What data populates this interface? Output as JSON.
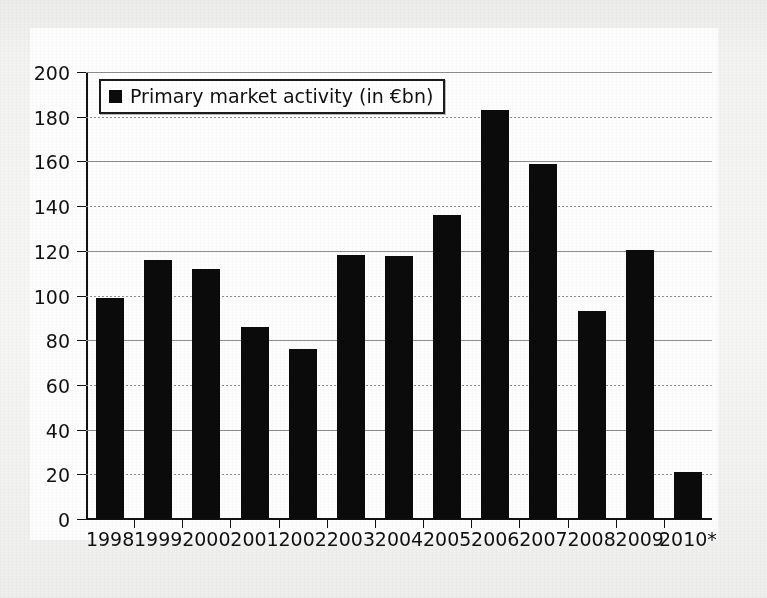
{
  "chart_data": {
    "type": "bar",
    "title": "",
    "subtitle": "",
    "xlabel": "",
    "ylabel": "",
    "ylim": [
      0,
      200
    ],
    "ytick_step": 20,
    "yticks": [
      "0",
      "20",
      "40",
      "60",
      "80",
      "100",
      "120",
      "140",
      "160",
      "180",
      "200"
    ],
    "grid": true,
    "grid_axis": "y",
    "legend_position": "top-left",
    "legend": [
      "Primary market activity (in €bn)"
    ],
    "series_name": "Primary market activity (in €bn)",
    "units": "€bn",
    "bar_color": "#0b0b0b",
    "categories": [
      "1998",
      "1999",
      "2000",
      "2001",
      "2002",
      "2003",
      "2004",
      "2005",
      "2006",
      "2007",
      "2008",
      "2009",
      "2010*"
    ],
    "values": [
      99,
      116,
      112,
      86,
      76,
      118,
      117.5,
      136,
      183,
      159,
      93,
      120.5,
      21
    ],
    "annotations": [
      "* 2010 figure is marked with an asterisk"
    ],
    "series": [
      {
        "name": "Primary market activity (in €bn)",
        "values": [
          99,
          116,
          112,
          86,
          76,
          118,
          117.5,
          136,
          183,
          159,
          93,
          120.5,
          21
        ]
      }
    ]
  },
  "legend": {
    "label": "Primary market activity (in €bn)",
    "marker": "filled-square"
  },
  "axes": {
    "y_ticks": [
      "200",
      "180",
      "160",
      "140",
      "120",
      "100",
      "80",
      "60",
      "40",
      "20",
      "0"
    ],
    "x_ticks": [
      "1998",
      "1999",
      "2000",
      "2001",
      "2002",
      "2003",
      "2004",
      "2005",
      "2006",
      "2007",
      "2008",
      "2009",
      "2010*"
    ]
  },
  "colors": {
    "bar": "#0b0b0b",
    "grid": "#8d8d8d",
    "axis": "#111111",
    "panel": "#fdfdfd",
    "page": "#f2f2f1"
  }
}
